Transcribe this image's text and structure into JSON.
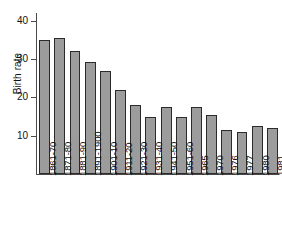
{
  "chart_data": {
    "type": "bar",
    "title": "",
    "xlabel": "",
    "ylabel": "Birth rate",
    "ylim": [
      0,
      42
    ],
    "yticks": [
      10,
      20,
      30,
      40
    ],
    "ytick_labels": [
      "10",
      "20",
      "30",
      "40"
    ],
    "grid": false,
    "legend": "none",
    "categories": [
      "1861-70",
      "1871-80",
      "1881-90",
      "1891-1900",
      "1901-10",
      "1911-20",
      "1921-30",
      "1931-40",
      "1941-50",
      "1951-60",
      "1965",
      "1970",
      "1976",
      "1977",
      "1980",
      "1981"
    ],
    "values": [
      35,
      35.5,
      32,
      29.3,
      27,
      22,
      18,
      15,
      17.5,
      15,
      17.5,
      15.5,
      11.5,
      11,
      12.5,
      12
    ],
    "bar_face_color": "#9c9c9c",
    "bar_edge_color": "#2b2b2b",
    "axis_color": "#4a4a4a",
    "background_color": "#ffffff"
  }
}
